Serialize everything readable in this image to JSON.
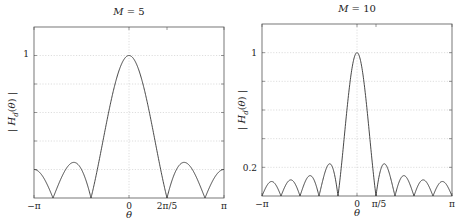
{
  "chart_data": [
    {
      "type": "line",
      "title": "M = 5",
      "title_var": "M",
      "title_value": "5",
      "xlabel": "θ",
      "ylabel": "|H_d(θ)|",
      "function": "|sin(M·θ/2) / (M·sin(θ/2))|",
      "M": 5,
      "xlim": [
        -3.14159,
        3.14159
      ],
      "ylim": [
        0,
        1.2
      ],
      "xticks": [
        {
          "value": -3.14159,
          "label": "−π"
        },
        {
          "value": 0,
          "label": "0"
        },
        {
          "value": 1.25664,
          "label": "2π/5"
        },
        {
          "value": 3.14159,
          "label": "π"
        }
      ],
      "yticks": [
        {
          "value": 1,
          "label": "1"
        }
      ],
      "grid": true,
      "grid_y": [
        0.2,
        0.4,
        0.6,
        0.8,
        1.0
      ],
      "grid_x": [
        0
      ],
      "x": [
        -3.1416,
        -2.5133,
        -1.885,
        -1.2566,
        -0.6283,
        0,
        0.6283,
        1.2566,
        1.885,
        2.5133,
        3.1416
      ],
      "values": [
        0.2,
        0.0,
        0.25,
        0.0,
        0.65,
        1.0,
        0.65,
        0.0,
        0.25,
        0.0,
        0.2
      ],
      "peak": {
        "x": 0,
        "y": 1.0
      },
      "nulls": [
        "±2π/5",
        "±4π/5"
      ],
      "sidelobe_peaks": [
        0.25,
        0.2
      ]
    },
    {
      "type": "line",
      "title": "M = 10",
      "title_var": "M",
      "title_value": "10",
      "xlabel": "θ",
      "ylabel": "|H_d(θ)|",
      "function": "|sin(M·θ/2) / (M·sin(θ/2))|",
      "M": 10,
      "xlim": [
        -3.14159,
        3.14159
      ],
      "ylim": [
        0,
        1.2
      ],
      "xticks": [
        {
          "value": -3.14159,
          "label": "−π"
        },
        {
          "value": 0,
          "label": "0"
        },
        {
          "value": 0.62832,
          "label": "π/5"
        },
        {
          "value": 3.14159,
          "label": "π"
        }
      ],
      "yticks": [
        {
          "value": 0.2,
          "label": "0.2"
        },
        {
          "value": 1,
          "label": "1"
        }
      ],
      "grid": true,
      "grid_y": [
        0.2,
        0.4,
        0.6,
        0.8,
        1.0
      ],
      "grid_x": [
        0
      ],
      "x": [
        -3.1416,
        -2.8274,
        -2.5133,
        -2.1991,
        -1.885,
        -1.5708,
        -1.2566,
        -0.9425,
        -0.6283,
        -0.3142,
        0,
        0.3142,
        0.6283,
        0.9425,
        1.2566,
        1.5708,
        1.885,
        2.1991,
        2.5133,
        2.8274,
        3.1416
      ],
      "values": [
        0.0,
        0.1,
        0.0,
        0.11,
        0.0,
        0.14,
        0.0,
        0.21,
        0.0,
        0.64,
        1.0,
        0.64,
        0.0,
        0.21,
        0.0,
        0.14,
        0.0,
        0.11,
        0.0,
        0.1,
        0.0
      ],
      "peak": {
        "x": 0,
        "y": 1.0
      },
      "nulls": [
        "±π/5",
        "±2π/5",
        "±3π/5",
        "±4π/5",
        "±π"
      ],
      "sidelobe_peaks": [
        0.21,
        0.14,
        0.11,
        0.1
      ]
    }
  ],
  "panels": [
    {
      "title_var": "M",
      "title_eq": " = 5",
      "xlabel": "θ",
      "ylabel": "|H_d(θ)|",
      "xticks": [
        "−π",
        "0",
        "2π/5",
        "π"
      ],
      "yticks": [
        "1"
      ]
    },
    {
      "title_var": "M",
      "title_eq": " = 10",
      "xlabel": "θ",
      "ylabel": "|H_d(θ)|",
      "xticks": [
        "−π",
        "0",
        "π/5",
        "π"
      ],
      "yticks": [
        "0.2",
        "1"
      ]
    }
  ],
  "colors": {
    "curve": "#333333",
    "axes": "#555555",
    "grid": "#c8c8c8"
  }
}
